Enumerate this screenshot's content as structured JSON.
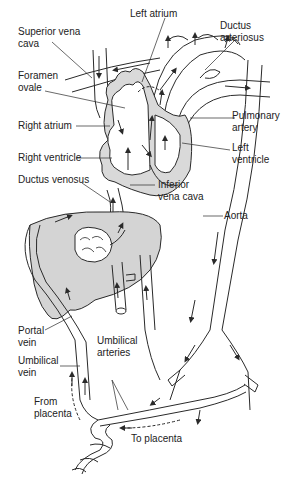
{
  "colors": {
    "stroke": "#2a2a2a",
    "organ_fill": "#d4d4d4",
    "heart_wall": "#9a9a9a",
    "text": "#222222",
    "background": "#ffffff"
  },
  "labels": {
    "superior_vena_cava": "Superior vena\ncava",
    "left_atrium": "Left atrium",
    "ductus_arteriosus": "Ductus\narteriosus",
    "foramen_ovale": "Foramen\novale",
    "pulmonary_artery": "Pulmonary\nartery",
    "right_atrium": "Right atrium",
    "left_ventricle": "Left\nventricle",
    "right_ventricle": "Right ventricle",
    "ductus_venosus": "Ductus venosus",
    "inferior_vena_cava": "Inferior\nvena cava",
    "aorta": "Aorta",
    "portal_vein": "Portal\nvein",
    "umbilical_arteries": "Umbilical\narteries",
    "umbilical_vein": "Umbilical\nvein",
    "from_placenta": "From\nplacenta",
    "to_placenta": "To placenta"
  }
}
